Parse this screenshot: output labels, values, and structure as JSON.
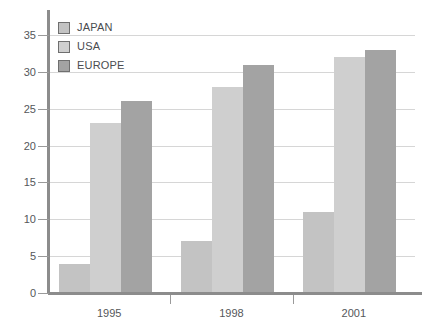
{
  "chart_data": {
    "type": "bar",
    "title": "",
    "subtitle": "",
    "xlabel": "",
    "ylabel": "",
    "categories": [
      "1995",
      "1998",
      "2001"
    ],
    "series": [
      {
        "name": "JAPAN",
        "values": [
          4,
          7,
          11
        ],
        "color": "#c3c3c3"
      },
      {
        "name": "USA",
        "values": [
          23,
          28,
          32
        ],
        "color": "#cfcfcf"
      },
      {
        "name": "EUROPE",
        "values": [
          26,
          31,
          33
        ],
        "color": "#a3a3a3"
      }
    ],
    "ylim": [
      0,
      35
    ],
    "ytick_labels": [
      "0",
      "5",
      "10",
      "15",
      "20",
      "25",
      "30",
      "35"
    ],
    "ytick_values": [
      0,
      5,
      10,
      15,
      20,
      25,
      30,
      35
    ],
    "grid": true,
    "legend_position": "top-left",
    "annotations": []
  },
  "legend": {
    "entries": [
      {
        "label": "JAPAN"
      },
      {
        "label": "USA"
      },
      {
        "label": "EUROPE"
      }
    ]
  },
  "axes": {
    "y_labels": [
      "35",
      "30",
      "25",
      "20",
      "15",
      "10",
      "5",
      "0"
    ],
    "x_labels": [
      "1995",
      "1998",
      "2001"
    ]
  },
  "colors": {
    "japan": "#c3c3c3",
    "usa": "#cfcfcf",
    "europe": "#a3a3a3",
    "gridline": "#d6d6d6",
    "axis": "#8c8c8c",
    "text": "#55575a"
  }
}
